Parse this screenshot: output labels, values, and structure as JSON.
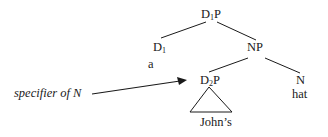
{
  "diagram": {
    "type": "syntax-tree",
    "nodes": {
      "root": {
        "cat": "D",
        "sub": "1",
        "suffix": "P"
      },
      "d1": {
        "cat": "D",
        "sub": "1",
        "suffix": ""
      },
      "d1_word": "a",
      "np": {
        "cat": "NP"
      },
      "d2p": {
        "cat": "D",
        "sub": "2",
        "suffix": "P"
      },
      "n": {
        "cat": "N"
      },
      "n_word": "hat",
      "d2p_word": "John’s"
    },
    "annotation": {
      "label": "specifier of N",
      "target": "d2p"
    },
    "edges": [
      [
        "root",
        "d1"
      ],
      [
        "root",
        "np"
      ],
      [
        "np",
        "d2p"
      ],
      [
        "np",
        "n"
      ]
    ],
    "colors": {
      "ink": "#1a1a1a",
      "background": "#ffffff"
    }
  }
}
